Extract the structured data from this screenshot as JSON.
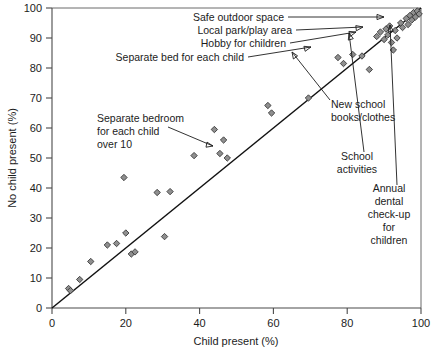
{
  "chart_data": {
    "type": "scatter",
    "title": "",
    "xlabel": "Child present (%)",
    "ylabel": "No child present (%)",
    "xlim": [
      0,
      100
    ],
    "ylim": [
      0,
      100
    ],
    "xticks": [
      0,
      20,
      40,
      60,
      80,
      100
    ],
    "yticks": [
      0,
      10,
      20,
      30,
      40,
      50,
      60,
      70,
      80,
      90,
      100
    ],
    "grid": false,
    "legend": "none",
    "reference_line": {
      "name": "equality-line",
      "description": "45 degree line of equality y = x",
      "from": [
        0,
        0
      ],
      "to": [
        100,
        100
      ]
    },
    "series": [
      {
        "name": "Items",
        "marker": "diamond",
        "color": "#8f8f8f",
        "points": [
          {
            "x": 4.5,
            "y": 6.5
          },
          {
            "x": 5.0,
            "y": 5.8
          },
          {
            "x": 7.5,
            "y": 9.5
          },
          {
            "x": 10.5,
            "y": 15.5
          },
          {
            "x": 15.0,
            "y": 21.0
          },
          {
            "x": 17.5,
            "y": 21.5
          },
          {
            "x": 19.5,
            "y": 43.5
          },
          {
            "x": 20.0,
            "y": 25.0
          },
          {
            "x": 21.5,
            "y": 18.0
          },
          {
            "x": 22.5,
            "y": 18.7
          },
          {
            "x": 28.5,
            "y": 38.5
          },
          {
            "x": 30.5,
            "y": 23.8
          },
          {
            "x": 32.0,
            "y": 38.8
          },
          {
            "x": 38.5,
            "y": 50.8
          },
          {
            "x": 44.0,
            "y": 59.5
          },
          {
            "x": 46.5,
            "y": 56.0
          },
          {
            "x": 45.5,
            "y": 51.5
          },
          {
            "x": 47.5,
            "y": 50.0
          },
          {
            "x": 58.5,
            "y": 67.5
          },
          {
            "x": 59.5,
            "y": 65.0
          },
          {
            "x": 69.5,
            "y": 70.0
          },
          {
            "x": 77.5,
            "y": 83.5
          },
          {
            "x": 79.0,
            "y": 81.5
          },
          {
            "x": 81.5,
            "y": 84.5
          },
          {
            "x": 84.0,
            "y": 84.0
          },
          {
            "x": 86.0,
            "y": 79.5
          },
          {
            "x": 88.0,
            "y": 90.5
          },
          {
            "x": 89.0,
            "y": 92.0
          },
          {
            "x": 90.0,
            "y": 89.5
          },
          {
            "x": 90.5,
            "y": 93.0
          },
          {
            "x": 91.0,
            "y": 91.0
          },
          {
            "x": 91.5,
            "y": 94.0
          },
          {
            "x": 92.0,
            "y": 88.5
          },
          {
            "x": 92.5,
            "y": 86.0
          },
          {
            "x": 93.0,
            "y": 92.5
          },
          {
            "x": 93.5,
            "y": 90.0
          },
          {
            "x": 94.5,
            "y": 95.0
          },
          {
            "x": 95.0,
            "y": 93.5
          },
          {
            "x": 96.0,
            "y": 96.5
          },
          {
            "x": 96.5,
            "y": 94.5
          },
          {
            "x": 97.0,
            "y": 97.5
          },
          {
            "x": 97.5,
            "y": 96.0
          },
          {
            "x": 98.0,
            "y": 98.5
          },
          {
            "x": 98.5,
            "y": 97.0
          },
          {
            "x": 99.0,
            "y": 99.0
          },
          {
            "x": 99.5,
            "y": 98.0
          }
        ]
      }
    ],
    "annotations": [
      {
        "id": "safe-outdoor-space",
        "label": "Safe outdoor space",
        "target": [
          96.0,
          96.5
        ]
      },
      {
        "id": "local-park-play-area",
        "label": "Local park/play area",
        "target": [
          91.0,
          91.0
        ]
      },
      {
        "id": "hobby-for-children",
        "label": "Hobby for children",
        "target": [
          84.0,
          84.0
        ]
      },
      {
        "id": "separate-bed-for-each-child",
        "label": "Separate bed for each child",
        "target": [
          79.0,
          81.5
        ]
      },
      {
        "id": "separate-bedroom-for-each-child-over-10",
        "label": "Separate bedroom\nfor each child\nover 10",
        "label_lines": [
          "Separate bedroom",
          "for each child",
          "over 10"
        ],
        "target": [
          46.5,
          56.0
        ]
      },
      {
        "id": "new-school-books-clothes",
        "label": "New school\nbooks/clothes",
        "label_lines": [
          "New school",
          "books/clothes"
        ],
        "target": [
          88.0,
          90.5
        ]
      },
      {
        "id": "school-activities",
        "label": "School\nactivities",
        "label_lines": [
          "School",
          "activities"
        ],
        "target": [
          92.0,
          99.0
        ]
      },
      {
        "id": "annual-dental-check-up-for-children",
        "label": "Annual\ndental\ncheck-up\nfor\nchildren",
        "label_lines": [
          "Annual",
          "dental",
          "check-up",
          "for",
          "children"
        ],
        "target": [
          97.5,
          99.5
        ]
      }
    ]
  },
  "axes": {
    "x_title": "Child present (%)",
    "y_title": "No child present (%)",
    "x_tick_labels": [
      "0",
      "20",
      "40",
      "60",
      "80",
      "100"
    ],
    "y_tick_labels": [
      "0",
      "10",
      "20",
      "30",
      "40",
      "50",
      "60",
      "70",
      "80",
      "90",
      "100"
    ]
  },
  "labels": {
    "safe_outdoor_space": "Safe outdoor space",
    "local_park_play_area": "Local park/play area",
    "hobby_for_children": "Hobby for children",
    "separate_bed_for_each_child": "Separate bed for each child",
    "separate_bedroom_l1": "Separate bedroom",
    "separate_bedroom_l2": "for each child",
    "separate_bedroom_l3": "over 10",
    "new_school_l1": "New school",
    "new_school_l2": "books/clothes",
    "school_activities_l1": "School",
    "school_activities_l2": "activities",
    "annual_dental_l1": "Annual",
    "annual_dental_l2": "dental",
    "annual_dental_l3": "check-up",
    "annual_dental_l4": "for",
    "annual_dental_l5": "children"
  },
  "colors": {
    "marker_fill": "#8f8f8f",
    "marker_stroke": "#3a3a3a",
    "line": "#111111",
    "axis": "#4a4a4a",
    "text": "#1c1c1c",
    "background": "#ffffff"
  }
}
